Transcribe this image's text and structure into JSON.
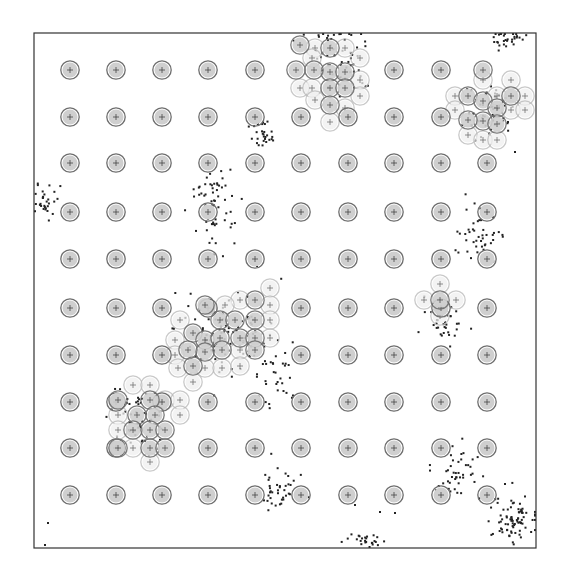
{
  "figure": {
    "width": 567,
    "height": 577,
    "frame": {
      "x0": 34,
      "y0": 33,
      "x1": 536,
      "y1": 548,
      "stroke": "#333333"
    },
    "colors": {
      "node_fill": "#cfcfcf",
      "node_stroke": "#6e6e6e",
      "ghost_fill": "#efefef",
      "ghost_stroke": "#b8b8b8",
      "plus": "#444444",
      "point": "#222222"
    },
    "node_radius": 8,
    "grid": {
      "cols_x": [
        70,
        116,
        162,
        208,
        255,
        301,
        348,
        394,
        441,
        487
      ],
      "rows_y": [
        70,
        117,
        163,
        212,
        259,
        308,
        355,
        402,
        448,
        495
      ]
    },
    "displaced_nodes": [
      {
        "x": 300,
        "y": 45
      },
      {
        "x": 330,
        "y": 48
      },
      {
        "x": 330,
        "y": 72
      },
      {
        "x": 345,
        "y": 72
      },
      {
        "x": 314,
        "y": 70
      },
      {
        "x": 330,
        "y": 88
      },
      {
        "x": 345,
        "y": 88
      },
      {
        "x": 330,
        "y": 105
      },
      {
        "x": 296,
        "y": 70
      },
      {
        "x": 483,
        "y": 70
      },
      {
        "x": 468,
        "y": 96
      },
      {
        "x": 483,
        "y": 101
      },
      {
        "x": 511,
        "y": 96
      },
      {
        "x": 483,
        "y": 121
      },
      {
        "x": 497,
        "y": 108
      },
      {
        "x": 468,
        "y": 120
      },
      {
        "x": 497,
        "y": 124
      },
      {
        "x": 440,
        "y": 300
      },
      {
        "x": 205,
        "y": 305
      },
      {
        "x": 220,
        "y": 320
      },
      {
        "x": 235,
        "y": 320
      },
      {
        "x": 255,
        "y": 300
      },
      {
        "x": 255,
        "y": 320
      },
      {
        "x": 193,
        "y": 333
      },
      {
        "x": 205,
        "y": 340
      },
      {
        "x": 220,
        "y": 338
      },
      {
        "x": 240,
        "y": 338
      },
      {
        "x": 255,
        "y": 338
      },
      {
        "x": 188,
        "y": 350
      },
      {
        "x": 205,
        "y": 352
      },
      {
        "x": 222,
        "y": 350
      },
      {
        "x": 255,
        "y": 350
      },
      {
        "x": 193,
        "y": 366
      },
      {
        "x": 118,
        "y": 400
      },
      {
        "x": 150,
        "y": 400
      },
      {
        "x": 137,
        "y": 415
      },
      {
        "x": 155,
        "y": 415
      },
      {
        "x": 133,
        "y": 430
      },
      {
        "x": 150,
        "y": 430
      },
      {
        "x": 165,
        "y": 430
      },
      {
        "x": 118,
        "y": 448
      },
      {
        "x": 150,
        "y": 448
      },
      {
        "x": 165,
        "y": 448
      }
    ],
    "ghost_nodes": [
      {
        "x": 315,
        "y": 48
      },
      {
        "x": 345,
        "y": 48
      },
      {
        "x": 312,
        "y": 58
      },
      {
        "x": 300,
        "y": 88
      },
      {
        "x": 312,
        "y": 88
      },
      {
        "x": 360,
        "y": 58
      },
      {
        "x": 360,
        "y": 80
      },
      {
        "x": 360,
        "y": 96
      },
      {
        "x": 345,
        "y": 108
      },
      {
        "x": 330,
        "y": 122
      },
      {
        "x": 315,
        "y": 100
      },
      {
        "x": 483,
        "y": 80
      },
      {
        "x": 511,
        "y": 80
      },
      {
        "x": 455,
        "y": 96
      },
      {
        "x": 497,
        "y": 96
      },
      {
        "x": 525,
        "y": 96
      },
      {
        "x": 455,
        "y": 110
      },
      {
        "x": 511,
        "y": 110
      },
      {
        "x": 525,
        "y": 110
      },
      {
        "x": 468,
        "y": 135
      },
      {
        "x": 483,
        "y": 140
      },
      {
        "x": 497,
        "y": 140
      },
      {
        "x": 440,
        "y": 284
      },
      {
        "x": 424,
        "y": 300
      },
      {
        "x": 456,
        "y": 300
      },
      {
        "x": 440,
        "y": 316
      },
      {
        "x": 270,
        "y": 288
      },
      {
        "x": 240,
        "y": 300
      },
      {
        "x": 225,
        "y": 305
      },
      {
        "x": 270,
        "y": 305
      },
      {
        "x": 270,
        "y": 320
      },
      {
        "x": 180,
        "y": 320
      },
      {
        "x": 270,
        "y": 338
      },
      {
        "x": 175,
        "y": 340
      },
      {
        "x": 240,
        "y": 350
      },
      {
        "x": 175,
        "y": 355
      },
      {
        "x": 178,
        "y": 368
      },
      {
        "x": 205,
        "y": 368
      },
      {
        "x": 222,
        "y": 368
      },
      {
        "x": 193,
        "y": 382
      },
      {
        "x": 240,
        "y": 366
      },
      {
        "x": 133,
        "y": 385
      },
      {
        "x": 150,
        "y": 385
      },
      {
        "x": 165,
        "y": 400
      },
      {
        "x": 180,
        "y": 400
      },
      {
        "x": 118,
        "y": 415
      },
      {
        "x": 180,
        "y": 415
      },
      {
        "x": 118,
        "y": 430
      },
      {
        "x": 133,
        "y": 448
      },
      {
        "x": 150,
        "y": 462
      }
    ],
    "clusters": [
      {
        "cx": 345,
        "cy": 60,
        "sx": 14,
        "sy": 18,
        "n": 45
      },
      {
        "cx": 335,
        "cy": 37,
        "sx": 20,
        "sy": 3,
        "n": 12
      },
      {
        "cx": 505,
        "cy": 38,
        "sx": 10,
        "sy": 5,
        "n": 30
      },
      {
        "cx": 490,
        "cy": 110,
        "sx": 12,
        "sy": 14,
        "n": 50
      },
      {
        "cx": 264,
        "cy": 135,
        "sx": 7,
        "sy": 10,
        "n": 30
      },
      {
        "cx": 44,
        "cy": 202,
        "sx": 6,
        "sy": 8,
        "n": 30
      },
      {
        "cx": 214,
        "cy": 205,
        "sx": 10,
        "sy": 22,
        "n": 65
      },
      {
        "cx": 480,
        "cy": 235,
        "sx": 14,
        "sy": 12,
        "n": 45
      },
      {
        "cx": 225,
        "cy": 330,
        "sx": 25,
        "sy": 20,
        "n": 90
      },
      {
        "cx": 275,
        "cy": 370,
        "sx": 12,
        "sy": 18,
        "n": 35
      },
      {
        "cx": 447,
        "cy": 322,
        "sx": 10,
        "sy": 10,
        "n": 35
      },
      {
        "cx": 140,
        "cy": 420,
        "sx": 15,
        "sy": 15,
        "n": 50
      },
      {
        "cx": 277,
        "cy": 490,
        "sx": 10,
        "sy": 9,
        "n": 40
      },
      {
        "cx": 455,
        "cy": 470,
        "sx": 12,
        "sy": 14,
        "n": 45
      },
      {
        "cx": 515,
        "cy": 520,
        "sx": 14,
        "sy": 13,
        "n": 80
      },
      {
        "cx": 365,
        "cy": 541,
        "sx": 8,
        "sy": 4,
        "n": 25
      }
    ],
    "stray_points": [
      {
        "x": 48,
        "y": 523
      },
      {
        "x": 45,
        "y": 545
      },
      {
        "x": 355,
        "y": 505
      },
      {
        "x": 395,
        "y": 513
      },
      {
        "x": 380,
        "y": 512
      },
      {
        "x": 505,
        "y": 484
      },
      {
        "x": 257,
        "y": 266
      },
      {
        "x": 515,
        "y": 152
      }
    ]
  }
}
